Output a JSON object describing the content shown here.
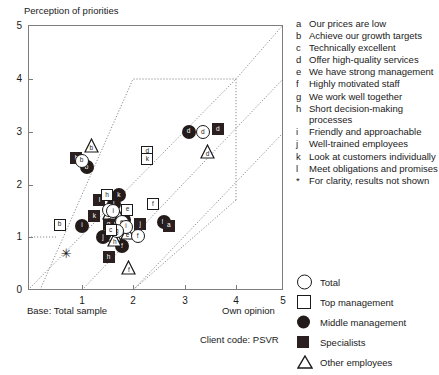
{
  "chart": {
    "title": "Perception of priorities",
    "xlabel": "Own opinion",
    "ylabel_note": "Perception of priorities",
    "base_label": "Base: Total sample",
    "client_code": "Client code:  PSVR",
    "xticks": [
      "0",
      "1",
      "2",
      "3",
      "4",
      "5"
    ],
    "yticks": [
      "0",
      "1",
      "2",
      "3",
      "4",
      "5"
    ]
  },
  "key": {
    "items": [
      {
        "letter": "a",
        "text": "Our prices are low"
      },
      {
        "letter": "b",
        "text": "Achieve our growth targets"
      },
      {
        "letter": "c",
        "text": "Technically excellent"
      },
      {
        "letter": "d",
        "text": "Offer high-quality services"
      },
      {
        "letter": "e",
        "text": "We have strong management"
      },
      {
        "letter": "f",
        "text": "Highly motivated staff"
      },
      {
        "letter": "g",
        "text": "We work well together"
      },
      {
        "letter": "h",
        "text": "Short decision-making processes"
      },
      {
        "letter": "i",
        "text": "Friendly and approachable"
      },
      {
        "letter": "j",
        "text": "Well-trained employees"
      },
      {
        "letter": "k",
        "text": "Look at customers individually"
      },
      {
        "letter": "l",
        "text": "Meet obligations and promises"
      },
      {
        "letter": "*",
        "text": "For clarity, results not shown"
      }
    ]
  },
  "symbol_key": {
    "items": [
      {
        "shape": "circle-open",
        "label": "Total"
      },
      {
        "shape": "square-open",
        "label": "Top management"
      },
      {
        "shape": "circle-filled",
        "label": "Middle management"
      },
      {
        "shape": "square-filled",
        "label": "Specialists"
      },
      {
        "shape": "triangle-open",
        "label": "Other employees"
      }
    ]
  },
  "chart_data": {
    "type": "scatter",
    "title": "Perception of priorities",
    "xlabel": "Own opinion",
    "ylabel": "Perception of priorities",
    "xlim": [
      0,
      5
    ],
    "ylim": [
      0,
      5
    ],
    "grid": false,
    "legend_position": "right",
    "annotations": [
      "Base: Total sample",
      "Client code:  PSVR"
    ],
    "series": [
      {
        "name": "Total",
        "shape": "circle-open",
        "points": [
          {
            "label": "b",
            "x": 1.05,
            "y": 2.45
          },
          {
            "label": "g",
            "x": 1.59,
            "y": 1.52
          },
          {
            "label": "i",
            "x": 1.67,
            "y": 1.5
          },
          {
            "label": "e",
            "x": 1.84,
            "y": 1.28
          },
          {
            "label": "i",
            "x": 1.92,
            "y": 1.2
          },
          {
            "label": "g",
            "x": 1.74,
            "y": 1.12
          },
          {
            "label": "f",
            "x": 2.15,
            "y": 1.02
          },
          {
            "label": "d",
            "x": 3.43,
            "y": 2.99
          }
        ]
      },
      {
        "name": "Top management",
        "shape": "square-open",
        "points": [
          {
            "label": "b",
            "x": 0.62,
            "y": 1.24
          },
          {
            "label": "h",
            "x": 1.55,
            "y": 1.8
          },
          {
            "label": "e",
            "x": 1.95,
            "y": 1.52
          },
          {
            "label": "c",
            "x": 1.62,
            "y": 1.13
          },
          {
            "label": "d",
            "x": 2.34,
            "y": 2.62
          },
          {
            "label": "k",
            "x": 2.34,
            "y": 2.48
          },
          {
            "label": "f",
            "x": 2.45,
            "y": 1.62
          }
        ]
      },
      {
        "name": "Middle management",
        "shape": "circle-filled",
        "points": [
          {
            "label": "b",
            "x": 1.15,
            "y": 2.33
          },
          {
            "label": "k",
            "x": 1.78,
            "y": 1.8
          },
          {
            "label": "l",
            "x": 1.68,
            "y": 1.62
          },
          {
            "label": "i",
            "x": 1.06,
            "y": 1.22
          },
          {
            "label": "e",
            "x": 1.88,
            "y": 1.32
          },
          {
            "label": "j",
            "x": 1.47,
            "y": 1.0
          },
          {
            "label": "f",
            "x": 1.84,
            "y": 0.83
          },
          {
            "label": "h",
            "x": 2.66,
            "y": 1.28
          },
          {
            "label": "d",
            "x": 3.15,
            "y": 3.0
          }
        ]
      },
      {
        "name": "Specialists",
        "shape": "square-filled",
        "points": [
          {
            "label": "b",
            "x": 0.95,
            "y": 2.5
          },
          {
            "label": "l",
            "x": 1.4,
            "y": 1.7
          },
          {
            "label": "k",
            "x": 1.3,
            "y": 1.4
          },
          {
            "label": "g",
            "x": 1.58,
            "y": 1.25
          },
          {
            "label": "j",
            "x": 2.2,
            "y": 1.25
          },
          {
            "label": "a",
            "x": 2.76,
            "y": 1.22
          },
          {
            "label": "h",
            "x": 1.58,
            "y": 0.62
          },
          {
            "label": "d",
            "x": 3.72,
            "y": 3.05
          }
        ]
      },
      {
        "name": "Other employees",
        "shape": "triangle-open",
        "points": [
          {
            "label": "b",
            "x": 1.24,
            "y": 2.74
          },
          {
            "label": "g",
            "x": 1.6,
            "y": 1.47
          },
          {
            "label": "c",
            "x": 1.8,
            "y": 1.38
          },
          {
            "label": "g",
            "x": 1.7,
            "y": 1.05
          },
          {
            "label": "e",
            "x": 1.95,
            "y": 1.08
          },
          {
            "label": "h",
            "x": 1.7,
            "y": 0.95
          },
          {
            "label": "f",
            "x": 1.98,
            "y": 0.42
          },
          {
            "label": "d",
            "x": 3.52,
            "y": 2.62
          }
        ]
      },
      {
        "name": "Not shown",
        "shape": "star",
        "points": [
          {
            "label": "*",
            "x": 0.75,
            "y": 0.7
          }
        ]
      }
    ]
  }
}
